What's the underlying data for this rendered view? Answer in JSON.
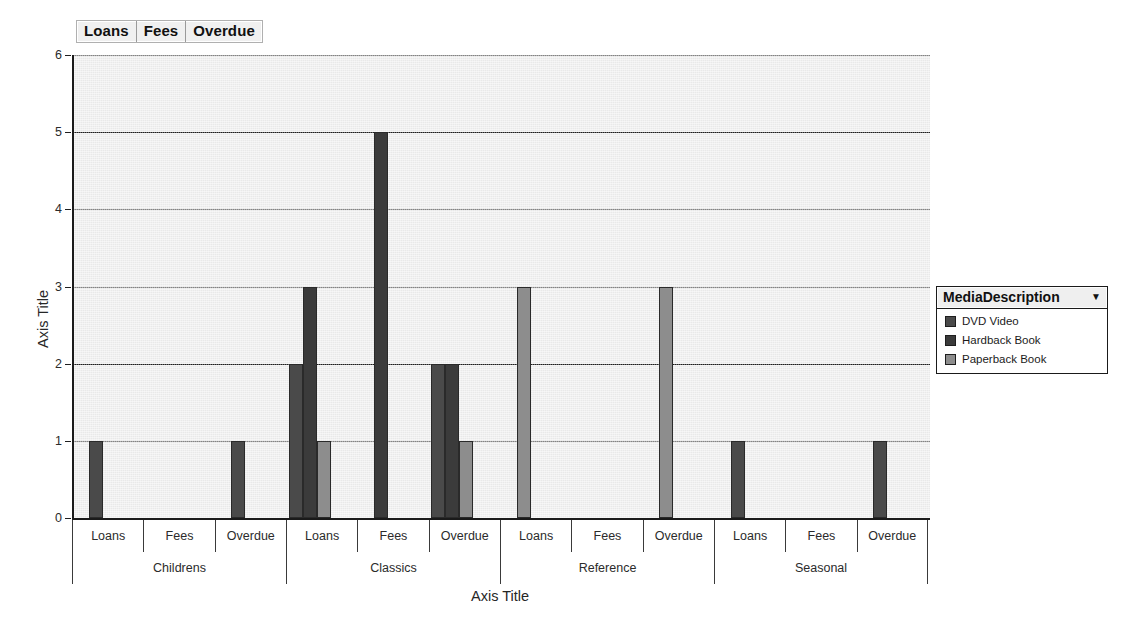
{
  "filter_header": {
    "cells": [
      "Loans",
      "Fees",
      "Overdue"
    ]
  },
  "legend": {
    "title": "MediaDescription",
    "caret": "▼",
    "items": [
      {
        "label": "DVD Video",
        "color": "#4a4a4a"
      },
      {
        "label": "Hardback Book",
        "color": "#3b3b3b"
      },
      {
        "label": "Paperback Book",
        "color": "#8d8d8d"
      }
    ]
  },
  "axes": {
    "y_title": "Axis Title",
    "x_title": "Axis Title",
    "y_ticks": [
      "0",
      "1",
      "2",
      "3",
      "4",
      "5",
      "6"
    ]
  },
  "chart_data": {
    "type": "bar",
    "title": "",
    "xlabel": "Axis Title",
    "ylabel": "Axis Title",
    "ylim": [
      0,
      6
    ],
    "yticks": [
      0,
      1,
      2,
      3,
      4,
      5,
      6
    ],
    "grid": true,
    "legend_position": "right",
    "legend_title": "MediaDescription",
    "group_level_1": [
      "Childrens",
      "Classics",
      "Reference",
      "Seasonal"
    ],
    "group_level_2": [
      "Loans",
      "Fees",
      "Overdue"
    ],
    "categories": [
      "Childrens / Loans",
      "Childrens / Fees",
      "Childrens / Overdue",
      "Classics / Loans",
      "Classics / Fees",
      "Classics / Overdue",
      "Reference / Loans",
      "Reference / Fees",
      "Reference / Overdue",
      "Seasonal / Loans",
      "Seasonal / Fees",
      "Seasonal / Overdue"
    ],
    "series": [
      {
        "name": "DVD Video",
        "color": "#4a4a4a",
        "values": [
          1,
          0,
          1,
          2,
          0,
          2,
          0,
          0,
          0,
          1,
          0,
          1
        ]
      },
      {
        "name": "Hardback Book",
        "color": "#3b3b3b",
        "values": [
          0,
          0,
          0,
          3,
          5,
          2,
          0,
          0,
          0,
          0,
          0,
          0
        ]
      },
      {
        "name": "Paperback Book",
        "color": "#8d8d8d",
        "values": [
          0,
          0,
          0,
          1,
          0,
          1,
          3,
          0,
          3,
          0,
          0,
          0
        ]
      }
    ]
  }
}
